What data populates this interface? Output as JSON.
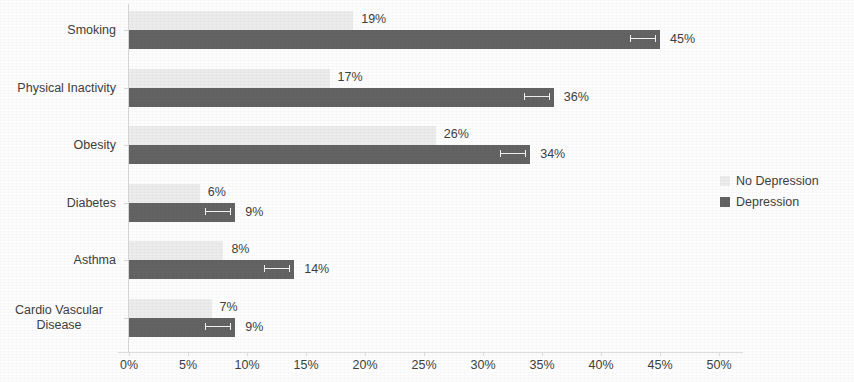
{
  "chart_data": {
    "type": "bar",
    "orientation": "horizontal",
    "title": "",
    "subtitle": "",
    "xlabel": "",
    "ylabel": "",
    "xlim": [
      0,
      50
    ],
    "xtick_labels": [
      "0%",
      "5%",
      "10%",
      "15%",
      "20%",
      "25%",
      "30%",
      "35%",
      "40%",
      "45%",
      "50%"
    ],
    "xtick_values": [
      0,
      5,
      10,
      15,
      20,
      25,
      30,
      35,
      40,
      45,
      50
    ],
    "grid": false,
    "legend_position": "right",
    "value_suffix": "%",
    "categories": [
      "Smoking",
      "Physical Inactivity",
      "Obesity",
      "Diabetes",
      "Asthma",
      "Cardio Vascular Disease"
    ],
    "series": [
      {
        "name": "No Depression",
        "color": "#ececec",
        "values": [
          19,
          17,
          26,
          6,
          8,
          7
        ],
        "labels": [
          "19%",
          "17%",
          "26%",
          "6%",
          "8%",
          "7%"
        ]
      },
      {
        "name": "Depression",
        "color": "#636363",
        "values": [
          45,
          36,
          34,
          9,
          14,
          9
        ],
        "labels": [
          "45%",
          "36%",
          "34%",
          "9%",
          "14%",
          "9%"
        ],
        "has_error_bars": true
      }
    ]
  },
  "legend": {
    "items": [
      {
        "label": "No Depression",
        "color": "#ececec"
      },
      {
        "label": "Depression",
        "color": "#636363"
      }
    ]
  }
}
